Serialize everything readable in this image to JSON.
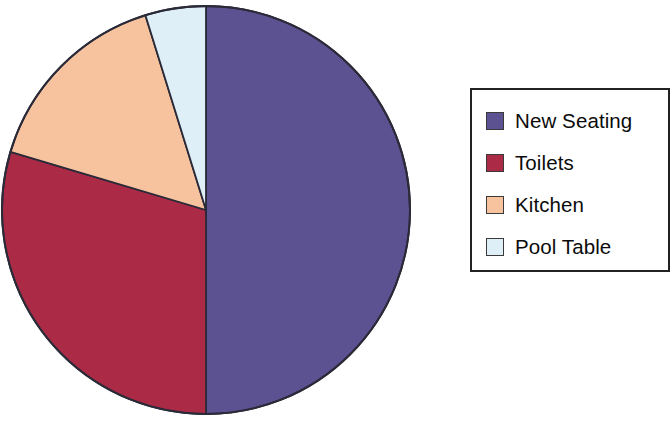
{
  "chart_data": {
    "type": "pie",
    "title": "",
    "categories": [
      "New Seating",
      "Toilets",
      "Kitchen",
      "Pool Table"
    ],
    "values": [
      50.0,
      29.6,
      15.6,
      4.8
    ],
    "unit": "percent",
    "total": 100.0,
    "start_angle_deg": 0,
    "direction": "clockwise",
    "slice_boundaries_deg": [
      0,
      180,
      286.6,
      342.6,
      360
    ],
    "colors": [
      "#5c5292",
      "#ab2b47",
      "#f7c29e",
      "#deeff8"
    ],
    "slice_border_color": "#2a2a38",
    "labels_shown_on_slices": false,
    "legend": {
      "position": "right",
      "border_color": "#222222",
      "background": "#ffffff",
      "entries": [
        {
          "label": "New Seating",
          "color": "#5c5292"
        },
        {
          "label": "Toilets",
          "color": "#ab2b47"
        },
        {
          "label": "Kitchen",
          "color": "#f7c29e"
        },
        {
          "label": "Pool Table",
          "color": "#deeff8"
        }
      ]
    },
    "geometry": {
      "center_x": 206,
      "center_y": 210,
      "radius": 204
    }
  }
}
